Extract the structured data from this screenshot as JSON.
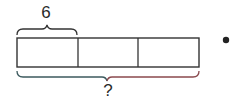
{
  "diagram": {
    "type": "tape-diagram",
    "segments": 3,
    "top_brace_label": "6",
    "bottom_brace_label": "?",
    "colors": {
      "stroke": "#333333",
      "bottom_brace_left": "#3d5a5e",
      "bottom_brace_right": "#8a4a4e",
      "dot": "#222222"
    }
  }
}
